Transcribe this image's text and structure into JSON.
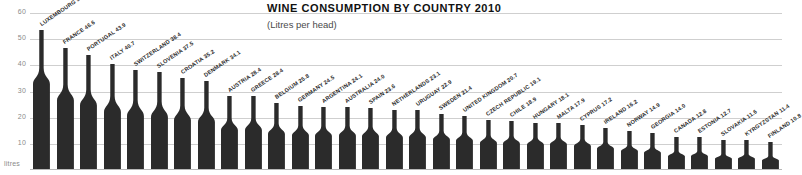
{
  "chart_data": {
    "type": "bar",
    "title": "WINE CONSUMPTION BY COUNTRY 2010",
    "subtitle": "(Litres per head)",
    "xlabel": "",
    "ylabel": "litres",
    "ylim": [
      0,
      62
    ],
    "yticks": [
      60,
      50,
      40,
      30,
      20,
      10
    ],
    "grid": true,
    "legend": null,
    "bar_style": "wine-bottle-silhouette",
    "bar_color": "#2b2b2b",
    "categories": [
      "LUXEMBOURG",
      "FRANCE",
      "PORTUGAL",
      "ITALY",
      "SWITZERLAND",
      "SLOVENIA",
      "CROATIA",
      "DENMARK",
      "AUSTRIA",
      "GREECE",
      "BELGIUM",
      "GERMANY",
      "ARGENTINA",
      "AUSTRALIA",
      "SPAIN",
      "NETHERLANDS",
      "URUGUAY",
      "SWEDEN",
      "UNITED KINGDOM",
      "CZECH REPUBLIC",
      "CHILE",
      "HUNGARY",
      "MALTA",
      "CYPRUS",
      "IRELAND",
      "NORWAY",
      "GEORGIA",
      "CANADA",
      "ESTONIA",
      "SLOVAKIA",
      "KYRGYZSTAN",
      "FINLAND"
    ],
    "values": [
      53.5,
      46.6,
      43.9,
      40.7,
      38.4,
      37.5,
      35.2,
      34.1,
      28.4,
      28.4,
      25.8,
      24.5,
      24.1,
      24.0,
      23.6,
      23.1,
      22.9,
      21.4,
      20.7,
      19.1,
      18.9,
      18.1,
      17.9,
      17.2,
      16.2,
      14.9,
      14.0,
      12.8,
      12.7,
      11.6,
      11.4,
      10.8
    ],
    "points": [
      {
        "country": "LUXEMBOURG",
        "value": 53.5,
        "label": "LUXEMBOURG 53.5"
      },
      {
        "country": "FRANCE",
        "value": 46.6,
        "label": "FRANCE 46.6"
      },
      {
        "country": "PORTUGAL",
        "value": 43.9,
        "label": "PORTUGAL 43.9"
      },
      {
        "country": "ITALY",
        "value": 40.7,
        "label": "ITALY 40.7"
      },
      {
        "country": "SWITZERLAND",
        "value": 38.4,
        "label": "SWITZERLAND 38.4"
      },
      {
        "country": "SLOVENIA",
        "value": 37.5,
        "label": "SLOVENIA 37.5"
      },
      {
        "country": "CROATIA",
        "value": 35.2,
        "label": "CROATIA 35.2"
      },
      {
        "country": "DENMARK",
        "value": 34.1,
        "label": "DENMARK 34.1"
      },
      {
        "country": "AUSTRIA",
        "value": 28.4,
        "label": "AUSTRIA 28.4"
      },
      {
        "country": "GREECE",
        "value": 28.4,
        "label": "GREECE 28.4"
      },
      {
        "country": "BELGIUM",
        "value": 25.8,
        "label": "BELGIUM 25.8"
      },
      {
        "country": "GERMANY",
        "value": 24.5,
        "label": "GERMANY 24.5"
      },
      {
        "country": "ARGENTINA",
        "value": 24.1,
        "label": "ARGENTINA 24.1"
      },
      {
        "country": "AUSTRALIA",
        "value": 24.0,
        "label": "AUSTRALIA 24.0"
      },
      {
        "country": "SPAIN",
        "value": 23.6,
        "label": "SPAIN 23.6"
      },
      {
        "country": "NETHERLANDS",
        "value": 23.1,
        "label": "NETHERLANDS 23.1"
      },
      {
        "country": "URUGUAY",
        "value": 22.9,
        "label": "URUGUAY 22.9"
      },
      {
        "country": "SWEDEN",
        "value": 21.4,
        "label": "SWEDEN 21.4"
      },
      {
        "country": "UNITED KINGDOM",
        "value": 20.7,
        "label": "UNITED KINGDOM 20.7"
      },
      {
        "country": "CZECH REPUBLIC",
        "value": 19.1,
        "label": "CZECH REPUBLIC 19.1"
      },
      {
        "country": "CHILE",
        "value": 18.9,
        "label": "CHILE 18.9"
      },
      {
        "country": "HUNGARY",
        "value": 18.1,
        "label": "HUNGARY 18.1"
      },
      {
        "country": "MALTA",
        "value": 17.9,
        "label": "MALTA 17.9"
      },
      {
        "country": "CYPRUS",
        "value": 17.2,
        "label": "CYPRUS 17.2"
      },
      {
        "country": "IRELAND",
        "value": 16.2,
        "label": "IRELAND 16.2"
      },
      {
        "country": "NORWAY",
        "value": 14.9,
        "label": "NORWAY 14.9"
      },
      {
        "country": "GEORGIA",
        "value": 14.0,
        "label": "GEORGIA 14.0"
      },
      {
        "country": "CANADA",
        "value": 12.8,
        "label": "CANADA 12.8"
      },
      {
        "country": "ESTONIA",
        "value": 12.7,
        "label": "ESTONIA 12.7"
      },
      {
        "country": "SLOVAKIA",
        "value": 11.6,
        "label": "SLOVAKIA 11.6"
      },
      {
        "country": "KYRGYZSTAN",
        "value": 11.4,
        "label": "KYRGYZSTAN 11.4"
      },
      {
        "country": "FINLAND",
        "value": 10.8,
        "label": "FINLAND 10.8"
      }
    ]
  }
}
